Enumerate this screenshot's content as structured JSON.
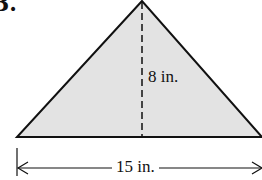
{
  "problem": {
    "number": "3."
  },
  "figure": {
    "shape": "triangle",
    "fill_color": "#e3e3e3",
    "stroke_color": "#111111",
    "height_label": "8 in.",
    "base_label": "15 in."
  }
}
